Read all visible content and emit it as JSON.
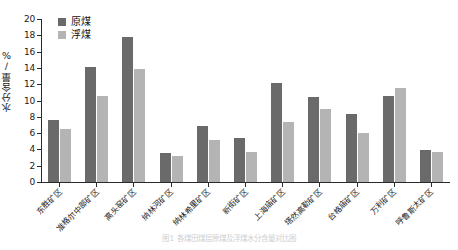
{
  "chart_data": {
    "type": "bar",
    "title": "",
    "caption": "图1  各煤田煤层原煤及浮煤水分含量对比图",
    "xlabel": "",
    "ylabel": "水分含量/%",
    "ylim": [
      0,
      20
    ],
    "yticks": [
      0,
      2,
      4,
      6,
      8,
      10,
      12,
      14,
      16,
      18,
      20
    ],
    "grid": false,
    "legend_position": "top-left",
    "categories": [
      "东胜矿区",
      "准格尔中部矿区",
      "高头窑矿区",
      "纳林河矿区",
      "纳林希里矿区",
      "新街矿区",
      "上海庙矿区",
      "塔然高勒矿区",
      "台格庙矿区",
      "万利矿区",
      "呼鲁斯太矿区"
    ],
    "series": [
      {
        "name": "原煤",
        "color": "#6a6a6a",
        "values": [
          7.6,
          14.1,
          17.8,
          3.5,
          6.9,
          5.4,
          12.2,
          10.4,
          8.3,
          10.5,
          3.9
        ]
      },
      {
        "name": "浮煤",
        "color": "#b4b4b4",
        "values": [
          6.5,
          10.6,
          13.9,
          3.2,
          5.1,
          3.7,
          7.4,
          8.9,
          6.0,
          11.5,
          3.7
        ]
      }
    ]
  }
}
